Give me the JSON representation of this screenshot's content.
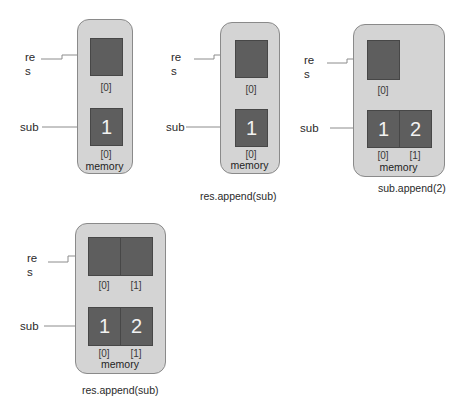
{
  "labels": {
    "res_line1": "re",
    "res_line2": "s",
    "sub": "sub",
    "memory": "memory"
  },
  "panels": [
    {
      "id": 1,
      "caption": "",
      "res_cells": [
        ""
      ],
      "res_indices": [
        "[0]"
      ],
      "sub_cells": [
        "1"
      ],
      "sub_indices": [
        "[0]"
      ]
    },
    {
      "id": 2,
      "caption": "res.append(sub)",
      "res_cells": [
        ""
      ],
      "res_indices": [
        "[0]"
      ],
      "sub_cells": [
        "1"
      ],
      "sub_indices": [
        "[0]"
      ]
    },
    {
      "id": 3,
      "caption": "sub.append(2)",
      "res_cells": [
        ""
      ],
      "res_indices": [
        "[0]"
      ],
      "sub_cells": [
        "1",
        "2"
      ],
      "sub_indices": [
        "[0]",
        "[1]"
      ]
    },
    {
      "id": 4,
      "caption": "res.append(sub)",
      "res_cells": [
        "",
        ""
      ],
      "res_indices": [
        "[0]",
        "[1]"
      ],
      "sub_cells": [
        "1",
        "2"
      ],
      "sub_indices": [
        "[0]",
        "[1]"
      ]
    }
  ],
  "colors": {
    "memory_bg": "#d4d4d4",
    "cell_fill": "#5e5e5e",
    "arrow": "#8c8c8c"
  }
}
